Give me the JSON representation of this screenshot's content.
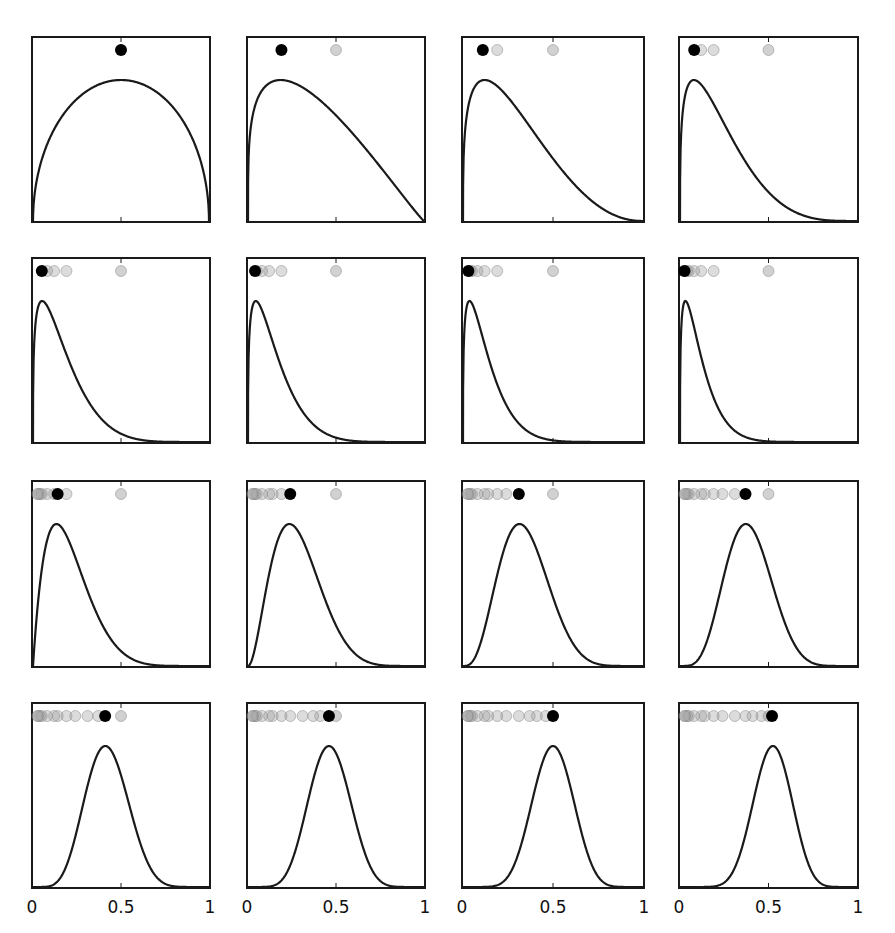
{
  "figure": {
    "layout": {
      "rows": 4,
      "cols": 4
    },
    "colors": {
      "curve": "#1a1a1a",
      "frame": "#1a1a1a",
      "current_dot": "#000000",
      "past_dot": "#9a9a9a",
      "reference_dot": "#c8c8c8"
    },
    "x_tick_labels": [
      "0",
      "0.5",
      "1"
    ],
    "reference_value": 0.5
  },
  "chart_data": {
    "type": "line",
    "title": "",
    "xlabel": "",
    "ylabel": "",
    "xlim": [
      0,
      1
    ],
    "x_ticks": [
      0,
      0.5,
      1
    ],
    "x_tick_labels": [
      "0",
      "0.5",
      "1"
    ],
    "grid": false,
    "legend": null,
    "panels": [
      {
        "index": 1,
        "beta_a": 1.5,
        "beta_b": 1.5,
        "mode": 0.5,
        "current_dot": 0.5,
        "past_dots": []
      },
      {
        "index": 2,
        "beta_a": 1.25,
        "beta_b": 2.1,
        "mode": 0.19,
        "current_dot": 0.19,
        "past_dots": [
          0.5
        ]
      },
      {
        "index": 3,
        "beta_a": 1.3,
        "beta_b": 3.2,
        "mode": 0.12,
        "current_dot": 0.11,
        "past_dots": [
          0.5,
          0.19
        ]
      },
      {
        "index": 4,
        "beta_a": 1.3,
        "beta_b": 4.5,
        "mode": 0.08,
        "current_dot": 0.08,
        "past_dots": [
          0.5,
          0.19,
          0.12
        ]
      },
      {
        "index": 5,
        "beta_a": 1.3,
        "beta_b": 6.5,
        "mode": 0.05,
        "current_dot": 0.05,
        "past_dots": [
          0.5,
          0.19,
          0.12,
          0.08
        ]
      },
      {
        "index": 6,
        "beta_a": 1.3,
        "beta_b": 7.5,
        "mode": 0.04,
        "current_dot": 0.04,
        "past_dots": [
          0.5,
          0.19,
          0.12,
          0.08,
          0.05
        ]
      },
      {
        "index": 7,
        "beta_a": 1.3,
        "beta_b": 9.0,
        "mode": 0.035,
        "current_dot": 0.03,
        "past_dots": [
          0.5,
          0.19,
          0.12,
          0.08,
          0.05,
          0.04
        ]
      },
      {
        "index": 8,
        "beta_a": 1.3,
        "beta_b": 10.5,
        "mode": 0.03,
        "current_dot": 0.025,
        "past_dots": [
          0.5,
          0.19,
          0.12,
          0.08,
          0.05,
          0.04,
          0.03
        ]
      },
      {
        "index": 9,
        "beta_a": 2.0,
        "beta_b": 7.5,
        "mode": 0.14,
        "current_dot": 0.14,
        "past_dots": [
          0.5,
          0.19,
          0.12,
          0.08,
          0.05,
          0.04,
          0.03,
          0.025
        ]
      },
      {
        "index": 10,
        "beta_a": 3.0,
        "beta_b": 7.5,
        "mode": 0.24,
        "current_dot": 0.24,
        "past_dots": [
          0.5,
          0.19,
          0.14,
          0.12,
          0.08,
          0.05,
          0.04,
          0.03,
          0.025
        ]
      },
      {
        "index": 11,
        "beta_a": 4.2,
        "beta_b": 8.0,
        "mode": 0.31,
        "current_dot": 0.31,
        "past_dots": [
          0.5,
          0.24,
          0.19,
          0.14,
          0.12,
          0.08,
          0.05,
          0.04,
          0.03,
          0.025
        ]
      },
      {
        "index": 12,
        "beta_a": 5.5,
        "beta_b": 8.6,
        "mode": 0.37,
        "current_dot": 0.37,
        "past_dots": [
          0.5,
          0.31,
          0.24,
          0.19,
          0.14,
          0.12,
          0.08,
          0.05,
          0.04,
          0.03,
          0.025
        ]
      },
      {
        "index": 13,
        "beta_a": 7.0,
        "beta_b": 9.6,
        "mode": 0.41,
        "current_dot": 0.41,
        "past_dots": [
          0.5,
          0.37,
          0.31,
          0.24,
          0.19,
          0.14,
          0.12,
          0.08,
          0.05,
          0.04,
          0.03,
          0.025
        ]
      },
      {
        "index": 14,
        "beta_a": 8.5,
        "beta_b": 9.8,
        "mode": 0.46,
        "current_dot": 0.46,
        "past_dots": [
          0.5,
          0.41,
          0.37,
          0.31,
          0.24,
          0.19,
          0.14,
          0.12,
          0.08,
          0.05,
          0.04,
          0.03,
          0.025
        ]
      },
      {
        "index": 15,
        "beta_a": 10.0,
        "beta_b": 10.0,
        "mode": 0.5,
        "current_dot": 0.5,
        "past_dots": [
          0.46,
          0.41,
          0.37,
          0.31,
          0.24,
          0.19,
          0.14,
          0.12,
          0.08,
          0.05,
          0.04,
          0.03,
          0.025
        ]
      },
      {
        "index": 16,
        "beta_a": 11.5,
        "beta_b": 10.5,
        "mode": 0.52,
        "current_dot": 0.52,
        "past_dots": [
          0.5,
          0.46,
          0.41,
          0.37,
          0.31,
          0.24,
          0.19,
          0.14,
          0.12,
          0.08,
          0.05,
          0.04,
          0.03,
          0.025
        ]
      }
    ]
  }
}
